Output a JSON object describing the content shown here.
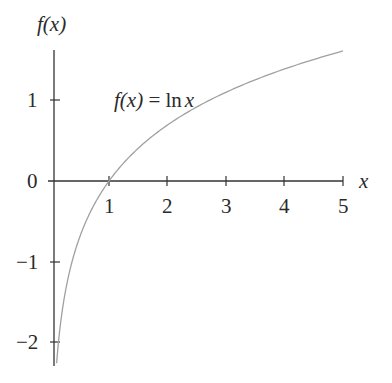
{
  "chart_data": {
    "type": "line",
    "title": "",
    "xlabel": "x",
    "ylabel": "f(x)",
    "annotation": "f(x) = ln x",
    "series": [
      {
        "name": "f(x) = ln x",
        "function": "ln(x)",
        "x_range": [
          0.105,
          5
        ],
        "x": [
          0.105,
          0.2,
          0.3,
          0.5,
          0.75,
          1,
          1.5,
          2,
          2.5,
          3,
          3.5,
          4,
          4.5,
          5
        ],
        "values": [
          -2.25,
          -1.61,
          -1.2,
          -0.69,
          -0.29,
          0,
          0.41,
          0.69,
          0.92,
          1.1,
          1.25,
          1.39,
          1.5,
          1.61
        ]
      }
    ],
    "x_ticks": [
      "1",
      "2",
      "3",
      "4",
      "5"
    ],
    "y_ticks": [
      "1",
      "0",
      "-1",
      "-2"
    ],
    "xlim": [
      0,
      5
    ],
    "ylim": [
      -2.3,
      1.7
    ],
    "grid": false,
    "legend": "none",
    "colors": {
      "curve": "#a0a0a0",
      "axis": "#333333"
    }
  },
  "labels": {
    "y_axis_title": "f(x)",
    "x_axis_title": "x",
    "annotation_lhs": "f(x)",
    "annotation_eq": " = ln",
    "annotation_x": "x",
    "xtick_1": "1",
    "xtick_2": "2",
    "xtick_3": "3",
    "xtick_4": "4",
    "xtick_5": "5",
    "ytick_1": "1",
    "ytick_0": "0",
    "ytick_m1": "−1",
    "ytick_m2": "−2"
  }
}
